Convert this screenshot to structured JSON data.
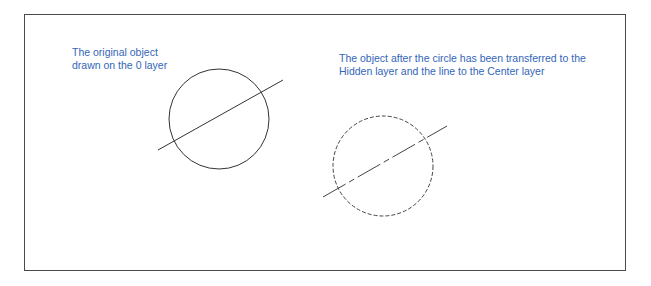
{
  "figure": {
    "border_color": "#4a4a4a",
    "caption_color": "#3366b8"
  },
  "left_panel": {
    "caption_line1": "The original object",
    "caption_line2": "drawn on the 0 layer",
    "circle": {
      "cx": 219,
      "cy": 119,
      "r": 50,
      "linetype": "continuous"
    },
    "line": {
      "x1": 158,
      "y1": 150,
      "x2": 283,
      "y2": 80,
      "linetype": "continuous"
    }
  },
  "right_panel": {
    "caption_line1": "The object after the circle has been transferred to the",
    "caption_line2": "Hidden layer and the line to the Center layer",
    "circle": {
      "cx": 383,
      "cy": 166,
      "r": 50,
      "linetype": "hidden"
    },
    "line": {
      "x1": 323,
      "y1": 197,
      "x2": 447,
      "y2": 126,
      "linetype": "center"
    }
  }
}
